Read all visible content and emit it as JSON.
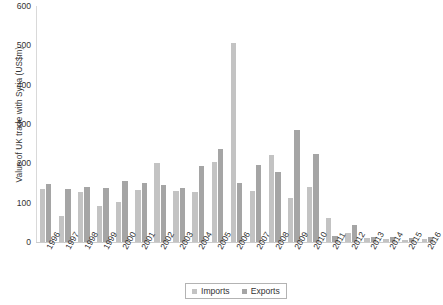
{
  "chart_data": {
    "type": "bar",
    "title": "",
    "xlabel": "",
    "ylabel": "Value of UK trade with Syria (US$m)",
    "ylim": [
      0,
      600
    ],
    "yticks": [
      0,
      100,
      200,
      300,
      400,
      500,
      600
    ],
    "grid": false,
    "legend_position": "bottom",
    "categories": [
      "1996",
      "1997",
      "1998",
      "1999",
      "2000",
      "2001",
      "2002",
      "2003",
      "2004",
      "2005",
      "2006",
      "2007",
      "2008",
      "2009",
      "2010",
      "2011",
      "2012",
      "2013",
      "2014",
      "2015",
      "2016"
    ],
    "series": [
      {
        "name": "Imports",
        "color": "#c3c3c3",
        "values": [
          135,
          66,
          128,
          92,
          101,
          131,
          202,
          130,
          128,
          204,
          505,
          130,
          222,
          113,
          140,
          61,
          24,
          10,
          8,
          6,
          7
        ]
      },
      {
        "name": "Exports",
        "color": "#a5a5a5",
        "values": [
          148,
          135,
          140,
          138,
          155,
          149,
          144,
          138,
          193,
          236,
          151,
          195,
          178,
          285,
          225,
          15,
          43,
          13,
          12,
          10,
          13
        ]
      }
    ]
  },
  "legend": {
    "items": [
      {
        "label": "Imports"
      },
      {
        "label": "Exports"
      }
    ]
  }
}
